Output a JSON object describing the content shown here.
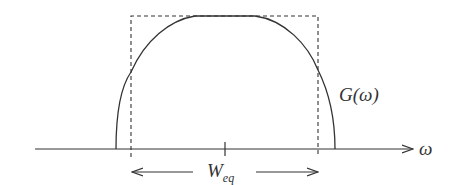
{
  "diagram": {
    "type": "equivalent-bandwidth-illustration",
    "curve_label": "G(ω)",
    "axis_label": "ω",
    "width_label_main": "W",
    "width_label_sub": "eq",
    "colors": {
      "stroke": "#333333",
      "background": "#ffffff"
    },
    "elements": [
      "horizontal frequency axis with arrow",
      "dome-shaped curve G(ω)",
      "dashed equivalent rectangle",
      "center tick mark",
      "double-headed width arrow labeled W_eq"
    ]
  }
}
